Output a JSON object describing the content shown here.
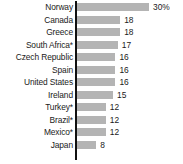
{
  "chart_data": {
    "type": "bar",
    "orientation": "horizontal",
    "title": "",
    "subtitle": "",
    "xlabel": "",
    "ylabel": "",
    "grid": false,
    "legend": "none",
    "axis_line": "vertical-left",
    "xlim": [
      0,
      30
    ],
    "unit": "%",
    "categories": [
      "Norway",
      "Canada",
      "Greece",
      "South Africa*",
      "Czech Republic",
      "Spain",
      "United States",
      "Ireland",
      "Turkey*",
      "Brazil*",
      "Mexico*",
      "Japan"
    ],
    "values": [
      30,
      18,
      18,
      17,
      16,
      16,
      16,
      15,
      12,
      12,
      12,
      8
    ],
    "value_labels": [
      "30%",
      "18",
      "18",
      "17",
      "16",
      "16",
      "16",
      "15",
      "12",
      "12",
      "12",
      "8"
    ],
    "colors": {
      "bar": "#b4b4b4",
      "axis": "#111111",
      "text": "#1a1a1a",
      "background": "#ffffff"
    }
  },
  "rows": [
    {
      "label": "Norway",
      "value": 30,
      "value_label": "30%"
    },
    {
      "label": "Canada",
      "value": 18,
      "value_label": "18"
    },
    {
      "label": "Greece",
      "value": 18,
      "value_label": "18"
    },
    {
      "label": "South Africa*",
      "value": 17,
      "value_label": "17"
    },
    {
      "label": "Czech Republic",
      "value": 16,
      "value_label": "16"
    },
    {
      "label": "Spain",
      "value": 16,
      "value_label": "16"
    },
    {
      "label": "United States",
      "value": 16,
      "value_label": "16"
    },
    {
      "label": "Ireland",
      "value": 15,
      "value_label": "15"
    },
    {
      "label": "Turkey*",
      "value": 12,
      "value_label": "12"
    },
    {
      "label": "Brazil*",
      "value": 12,
      "value_label": "12"
    },
    {
      "label": "Mexico*",
      "value": 12,
      "value_label": "12"
    },
    {
      "label": "Japan",
      "value": 8,
      "value_label": "8"
    }
  ],
  "layout": {
    "row_pitch_px": 12.5,
    "first_row_top_px": 2,
    "bar_height_px": 8,
    "bar_origin_x_px": 77,
    "px_per_unit": 2.4,
    "value_gap_px": 4
  }
}
